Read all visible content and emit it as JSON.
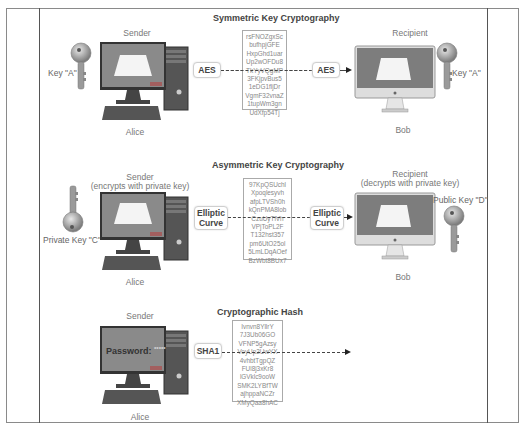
{
  "frame": {
    "border_color": "#8a8a8a",
    "divider_color": "#555555"
  },
  "sections": [
    {
      "title": "Symmetric Key Cryptography",
      "sender": {
        "role": "Sender",
        "name": "Alice",
        "key_label": "Key \"A\""
      },
      "recipient": {
        "role": "Recipient",
        "name": "Bob",
        "key_label": "Key \"A\""
      },
      "algorithm_left": "AES",
      "algorithm_right": "AES",
      "ciphertext": [
        "rsFNOZgxSc",
        "bufhpjGFE",
        "HxpGhd1uar",
        "Up2wOFDu8",
        "TkYyVQgMP",
        "3FKjpvBus5",
        "1eDG1fljDr",
        "VgmF32vnaZ",
        "1tupWm3gn",
        "UdXfp54Tj"
      ]
    },
    {
      "title": "Asymmetric Key Cryptography",
      "sender": {
        "role": "Sender",
        "role_note": "(encrypts with private key)",
        "name": "Alice",
        "key_label": "Private Key \"C\""
      },
      "recipient": {
        "role": "Recipient",
        "role_note": "(decrypts with private key)",
        "name": "Bob",
        "key_label": "Public Key \"D\""
      },
      "algorithm_left": "Elliptic Curve",
      "algorithm_right": "Elliptic Curve",
      "ciphertext": [
        "97KpQSUchl",
        "Xpoqlesyvh",
        "afpLTVSh0h",
        "kQnPMA8lob",
        "CzuUyTlVh",
        "VPjToPL2F",
        "T132hst357",
        "pm6UtO25ol",
        "5LmLDqAOef",
        "BzWbt8BUx7"
      ]
    },
    {
      "title": "Cryptographic Hash",
      "sender": {
        "role": "Sender",
        "name": "Alice",
        "screen_text": "Password:",
        "masked": "*****"
      },
      "algorithm_left": "SHA1",
      "ciphertext": [
        "Ivnvn8YllrY",
        "7J3Ub06GO",
        "VFNP5gAzsy",
        "VoyUp2UwYX",
        "4vhbtTgpQZ",
        "FUl8j3xKr8",
        "lGVklc9ooW",
        "SMK2LYBfTW",
        "ajhppaNCZr",
        "XMyQaa8hAC"
      ]
    }
  ]
}
